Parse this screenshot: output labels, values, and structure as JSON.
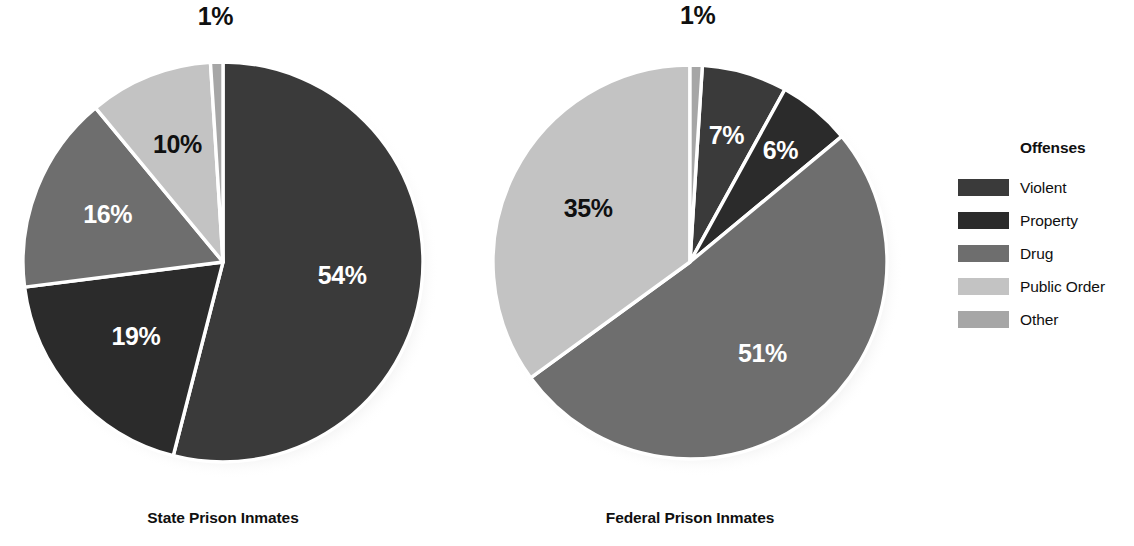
{
  "legend": {
    "title": "Offenses",
    "items": [
      {
        "label": "Violent",
        "color": "#3a3a3a"
      },
      {
        "label": "Property",
        "color": "#2b2b2b"
      },
      {
        "label": "Drug",
        "color": "#6e6e6e"
      },
      {
        "label": "Public Order",
        "color": "#c3c3c3"
      },
      {
        "label": "Other",
        "color": "#a6a6a6"
      }
    ]
  },
  "charts": [
    {
      "caption": "State Prison Inmates",
      "center_x": 223,
      "center_y": 262,
      "radius": 200,
      "start_angle": 0,
      "slices": [
        {
          "category": "Violent",
          "value": 54,
          "label": "54%",
          "color": "#3a3a3a",
          "label_color": "light",
          "label_r": 0.6
        },
        {
          "category": "Property",
          "value": 19,
          "label": "19%",
          "color": "#2b2b2b",
          "label_color": "light",
          "label_r": 0.58
        },
        {
          "category": "Drug",
          "value": 16,
          "label": "16%",
          "color": "#6e6e6e",
          "label_color": "light",
          "label_r": 0.62
        },
        {
          "category": "Public Order",
          "value": 10,
          "label": "10%",
          "color": "#c3c3c3",
          "label_color": "dark",
          "label_r": 0.62
        },
        {
          "category": "Other",
          "value": 1,
          "label": "1%",
          "color": "#a6a6a6",
          "label_color": "outside",
          "label_r": 1.22
        }
      ]
    },
    {
      "caption": "Federal Prison Inmates",
      "center_x": 690,
      "center_y": 262,
      "radius": 197,
      "start_angle": 3.6,
      "slices": [
        {
          "category": "Violent",
          "value": 7,
          "label": "7%",
          "color": "#3a3a3a",
          "label_color": "light",
          "label_r": 0.66
        },
        {
          "category": "Property",
          "value": 6,
          "label": "6%",
          "color": "#2b2b2b",
          "label_color": "light",
          "label_r": 0.72
        },
        {
          "category": "Drug",
          "value": 51,
          "label": "51%",
          "color": "#6e6e6e",
          "label_color": "light",
          "label_r": 0.6
        },
        {
          "category": "Public Order",
          "value": 35,
          "label": "35%",
          "color": "#c3c3c3",
          "label_color": "dark",
          "label_r": 0.58
        },
        {
          "category": "Other",
          "value": 1,
          "label": "1%",
          "color": "#a6a6a6",
          "label_color": "outside",
          "label_r": 1.24
        }
      ]
    }
  ],
  "chart_data": {
    "type": "pie",
    "title": "",
    "categories": [
      "Violent",
      "Property",
      "Drug",
      "Public Order",
      "Other"
    ],
    "unit": "percent",
    "legend_title": "Offenses",
    "legend_position": "right",
    "grid": false,
    "series": [
      {
        "name": "State Prison Inmates",
        "values": [
          54,
          19,
          16,
          10,
          1
        ]
      },
      {
        "name": "Federal Prison Inmates",
        "values": [
          7,
          6,
          51,
          35,
          1
        ]
      }
    ],
    "colors": {
      "Violent": "#3a3a3a",
      "Property": "#2b2b2b",
      "Drug": "#6e6e6e",
      "Public Order": "#c3c3c3",
      "Other": "#a6a6a6"
    },
    "data_labels": {
      "State Prison Inmates": [
        "54%",
        "19%",
        "16%",
        "10%",
        "1%"
      ],
      "Federal Prison Inmates": [
        "7%",
        "6%",
        "51%",
        "35%",
        "1%"
      ]
    }
  }
}
